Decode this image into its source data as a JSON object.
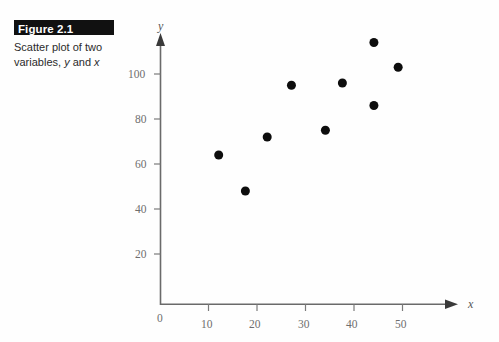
{
  "figure": {
    "banner_label": "Figure 2.1",
    "caption_line1": "Scatter plot of two",
    "caption_line2_prefix": "variables, ",
    "caption_var_y": "y",
    "caption_line2_mid": " and ",
    "caption_var_x": "x",
    "banner_background": "#111111",
    "banner_text_color": "#ffffff"
  },
  "chart_data": {
    "type": "scatter",
    "title": "Scatter plot of two variables, y and x",
    "xlabel": "x",
    "ylabel": "y",
    "xlim": [
      0,
      58
    ],
    "ylim": [
      0,
      120
    ],
    "xticks": [
      0,
      10,
      20,
      30,
      40,
      50
    ],
    "yticks": [
      0,
      20,
      40,
      60,
      80,
      100
    ],
    "xtick_labels": [
      "0",
      "10",
      "20",
      "30",
      "40",
      "50"
    ],
    "ytick_labels": [
      "0",
      "20",
      "40",
      "60",
      "80",
      "100"
    ],
    "origin_label": "0",
    "grid": false,
    "legend": false,
    "marker_color": "#0d0d0d",
    "marker_size": 9,
    "axis_color": "#6a6a6a",
    "tick_label_color": "#6e6e6e",
    "points": [
      {
        "x": 12,
        "y": 64
      },
      {
        "x": 17.5,
        "y": 48
      },
      {
        "x": 22,
        "y": 72
      },
      {
        "x": 27,
        "y": 95
      },
      {
        "x": 34,
        "y": 75
      },
      {
        "x": 37.5,
        "y": 96
      },
      {
        "x": 44,
        "y": 114
      },
      {
        "x": 44,
        "y": 86
      },
      {
        "x": 49,
        "y": 103
      }
    ]
  }
}
